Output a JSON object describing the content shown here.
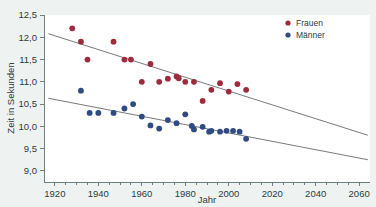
{
  "chart_data": {
    "type": "scatter",
    "title": "",
    "xlabel": "Jahr",
    "ylabel": "Zeit in Sekunden",
    "xlim": [
      1915,
      2065
    ],
    "ylim": [
      8.75,
      12.5
    ],
    "xticks": [
      1920,
      1940,
      1960,
      1980,
      2000,
      2020,
      2040,
      2060
    ],
    "xtick_labels": [
      "1920",
      "1940",
      "1960",
      "1980",
      "2000",
      "2020",
      "2040",
      "2060"
    ],
    "yticks": [
      9.0,
      9.5,
      10.0,
      10.5,
      11.0,
      11.5,
      12.0,
      12.5
    ],
    "ytick_labels": [
      "9,0",
      "9,5",
      "10,0",
      "10,5",
      "11,0",
      "11,5",
      "12,0",
      "12,5"
    ],
    "grid": false,
    "legend_position": "top-right",
    "series": [
      {
        "name": "Frauen",
        "color": "#9e2b3c",
        "x": [
          1928,
          1932,
          1935,
          1947,
          1952,
          1955,
          1960,
          1964,
          1968,
          1972,
          1976,
          1977,
          1980,
          1984,
          1988,
          1992,
          1996,
          2000,
          2004,
          2008
        ],
        "y": [
          12.2,
          11.9,
          11.5,
          11.9,
          11.5,
          11.5,
          11.0,
          11.4,
          11.0,
          11.07,
          11.12,
          11.08,
          11.0,
          11.0,
          10.57,
          10.82,
          10.97,
          10.78,
          10.95,
          10.82
        ],
        "trend": {
          "x": [
            1917,
            2064
          ],
          "y": [
            12.08,
            9.8
          ]
        }
      },
      {
        "name": "Männer",
        "color": "#2f4b82",
        "x": [
          1932,
          1936,
          1940,
          1947,
          1952,
          1956,
          1960,
          1964,
          1968,
          1972,
          1976,
          1980,
          1983,
          1984,
          1988,
          1991,
          1992,
          1996,
          1999,
          2002,
          2005,
          2008
        ],
        "y": [
          10.8,
          10.3,
          10.3,
          10.3,
          10.4,
          10.5,
          10.22,
          10.02,
          9.95,
          10.14,
          10.07,
          10.27,
          10.01,
          9.93,
          9.99,
          9.88,
          9.9,
          9.88,
          9.9,
          9.9,
          9.88,
          9.72
        ],
        "trend": {
          "x": [
            1917,
            2064
          ],
          "y": [
            10.63,
            9.25
          ]
        }
      }
    ]
  },
  "legend": {
    "entries": [
      {
        "label": "Frauen",
        "color": "#9e2b3c"
      },
      {
        "label": "Männer",
        "color": "#2f4b82"
      }
    ]
  },
  "axes": {
    "x_title": "Jahr",
    "y_title": "Zeit in Sekunden"
  },
  "top_cut_text": ""
}
